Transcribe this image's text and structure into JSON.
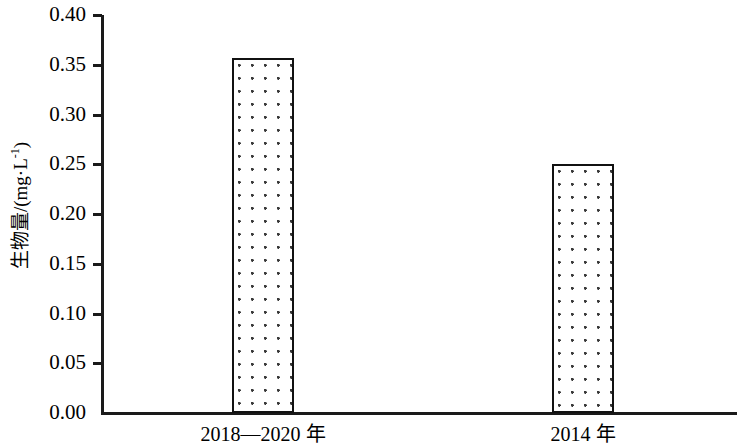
{
  "chart_data": {
    "type": "bar",
    "title": "",
    "xlabel": "",
    "ylabel": "生物量/(mg·L⁻¹)",
    "ylabel_parts": {
      "prefix": "生物量/(mg·L",
      "superscript": "-1",
      "suffix": ")"
    },
    "categories": [
      "2018—2020 年",
      "2014 年"
    ],
    "values": [
      0.357,
      0.25
    ],
    "ylim": [
      0.0,
      0.4
    ],
    "ytick_step": 0.05,
    "ytick_labels": [
      "0.40",
      "0.35",
      "0.30",
      "0.25",
      "0.20",
      "0.15",
      "0.10",
      "0.05",
      "0.00"
    ],
    "ytick_values": [
      0.4,
      0.35,
      0.3,
      0.25,
      0.2,
      0.15,
      0.1,
      0.05,
      0.0
    ],
    "grid": false,
    "legend": false,
    "legend_position": "none",
    "bar_fill": "dotted-stipple",
    "bar_edge_color": "#111111",
    "bar_face_color": "#ffffff",
    "axis_color": "#1a1a1a",
    "background_color": "#ffffff"
  },
  "axis": {
    "y_title": "生物量/(mg·L⁻¹)"
  }
}
